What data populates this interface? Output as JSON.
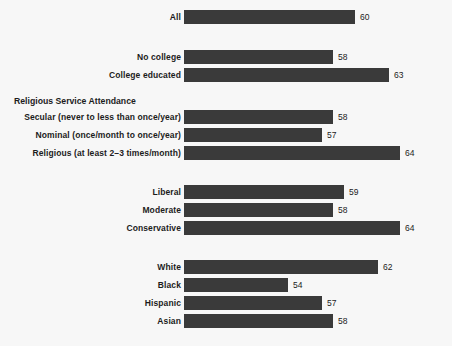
{
  "chart_data": {
    "type": "bar",
    "title": "",
    "subtitle": "",
    "xlabel": "",
    "ylabel": "",
    "orientation": "horizontal",
    "grid": false,
    "legend": false,
    "xlim": [
      0,
      70
    ],
    "value_axis_visible": false,
    "groups": [
      {
        "header": "",
        "categories": [
          "All"
        ],
        "values": [
          60
        ]
      },
      {
        "header": "",
        "categories": [
          "No college",
          "College educated"
        ],
        "values": [
          58,
          63
        ]
      },
      {
        "header": "Religious Service Attendance",
        "categories": [
          "Secular (never to less than once/year)",
          "Nominal (once/month to once/year)",
          "Religious (at least 2–3 times/month)"
        ],
        "values": [
          58,
          57,
          64
        ]
      },
      {
        "header": "",
        "categories": [
          "Liberal",
          "Moderate",
          "Conservative"
        ],
        "values": [
          59,
          58,
          64
        ]
      },
      {
        "header": "",
        "categories": [
          "White",
          "Black",
          "Hispanic",
          "Asian"
        ],
        "values": [
          62,
          54,
          57,
          58
        ]
      }
    ],
    "categories": [
      "All",
      "No college",
      "College educated",
      "Secular (never to less than once/year)",
      "Nominal (once/month to once/year)",
      "Religious (at least 2–3 times/month)",
      "Liberal",
      "Moderate",
      "Conservative",
      "White",
      "Black",
      "Hispanic",
      "Asian"
    ],
    "values": [
      60,
      58,
      63,
      58,
      57,
      64,
      59,
      58,
      64,
      62,
      54,
      57,
      58
    ],
    "colors": {
      "bar": "#3a3a3a",
      "background": "#f7f7f7",
      "text": "#1c1c1c"
    }
  }
}
